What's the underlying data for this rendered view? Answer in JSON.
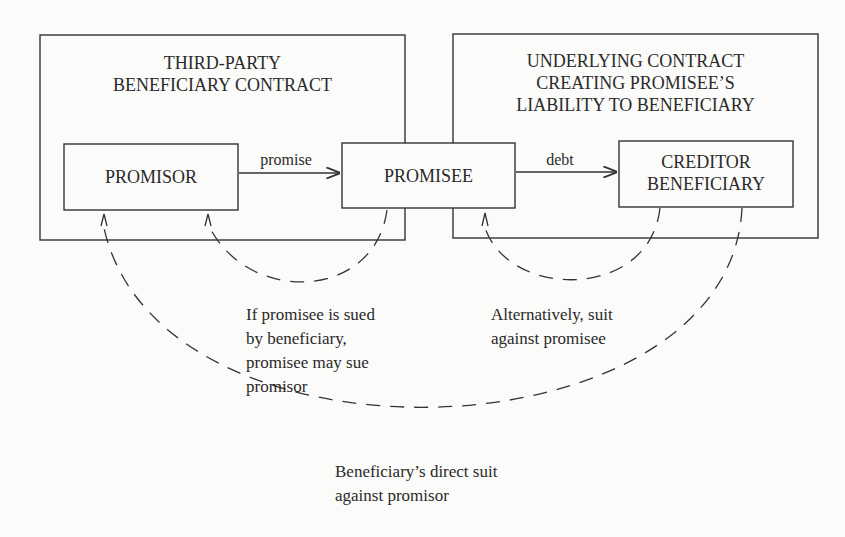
{
  "boxes": {
    "third_party": {
      "line1": "THIRD-PARTY",
      "line2": "BENEFICIARY CONTRACT"
    },
    "underlying": {
      "line1": "UNDERLYING CONTRACT",
      "line2": "CREATING PROMISEE’S",
      "line3": "LIABILITY TO BENEFICIARY"
    },
    "promisor": "PROMISOR",
    "promisee": "PROMISEE",
    "creditor": {
      "line1": "CREDITOR",
      "line2": "BENEFICIARY"
    }
  },
  "arrows": {
    "promise": "promise",
    "debt": "debt"
  },
  "annotations": {
    "promisee_sues": [
      "If promisee is sued",
      "by beneficiary,",
      "promisee may sue",
      "promisor"
    ],
    "alternative": [
      "Alternatively, suit",
      "against promisee"
    ],
    "direct_suit": [
      "Beneficiary’s direct suit",
      "against promisor"
    ]
  },
  "colors": {
    "line": "#333333",
    "background": "#fbfbf9"
  }
}
